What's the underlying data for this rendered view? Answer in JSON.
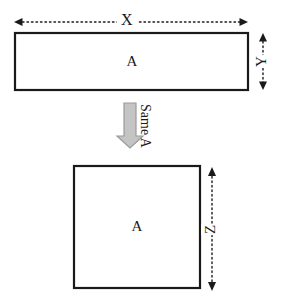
{
  "diagram": {
    "background_color": "#ffffff",
    "stroke_color": "#1a1a1a",
    "arrow_fill_color": "#bfbfbf",
    "arrow_stroke_color": "#808080",
    "top_shape": {
      "name": "rectangle",
      "area_label": "A",
      "width_label": "X",
      "height_label": "Y"
    },
    "bottom_shape": {
      "name": "square",
      "area_label": "A",
      "side_label": "Z"
    },
    "transition": {
      "caption": "Same A",
      "arrow_direction": "down"
    }
  }
}
